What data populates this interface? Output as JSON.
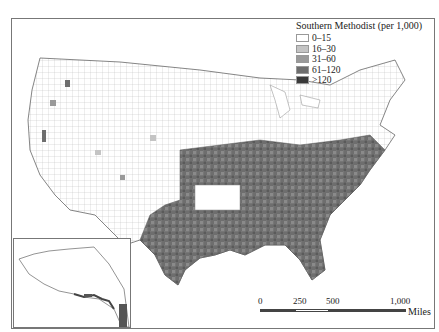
{
  "map": {
    "title": "Southern Methodist (per 1,000)",
    "region": "Contiguous United States counties with Alaska inset",
    "legend": {
      "title": "Southern Methodist (per 1,000)",
      "classes": [
        {
          "label": "0–15",
          "color": "#ffffff"
        },
        {
          "label": "16–30",
          "color": "#c4c4c4"
        },
        {
          "label": "31–60",
          "color": "#9a9a9a"
        },
        {
          "label": "61–120",
          "color": "#6e6e6e"
        },
        {
          "label": ">120",
          "color": "#3a3a3a"
        }
      ]
    },
    "scale_bar": {
      "ticks": [
        "0",
        "250",
        "500",
        "1,000"
      ],
      "unit": "Miles"
    },
    "inset_label": "Alaska"
  }
}
